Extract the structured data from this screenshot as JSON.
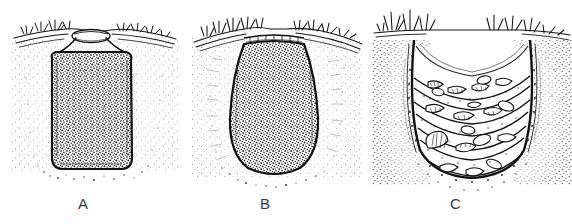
{
  "figure": {
    "background_color": "#ffffff",
    "ink_color": "#1a1a1a",
    "caption_color": "#3a3a3a",
    "width": 572,
    "height": 224
  },
  "panels": [
    {
      "id": "A",
      "label": "A",
      "description": "Rectangular straight-sided pit, sealed with a capstone at the mouth, filled with homogeneous dark stippled fill",
      "ground_surface": "turf line with grass tufts",
      "fill_texture": "dense stipple",
      "pit_shape": "rectangular / straight-sided",
      "mouth": "narrow, capped"
    },
    {
      "id": "B",
      "label": "B",
      "description": "Bell-shaped pit with rounded base, open mouth, filled with homogeneous dark stippled fill",
      "ground_surface": "turf line with grass tufts",
      "fill_texture": "dense stipple",
      "pit_shape": "bell-shaped / rounded base",
      "mouth": "narrow, open"
    },
    {
      "id": "C",
      "label": "C",
      "description": "Wide flaring pit with layered lenses of shell and debris in the fill",
      "ground_surface": "turf line with grass tufts",
      "fill_texture": "layered shell lenses",
      "pit_shape": "flaring / bucket-shaped",
      "mouth": "wide, open"
    }
  ]
}
